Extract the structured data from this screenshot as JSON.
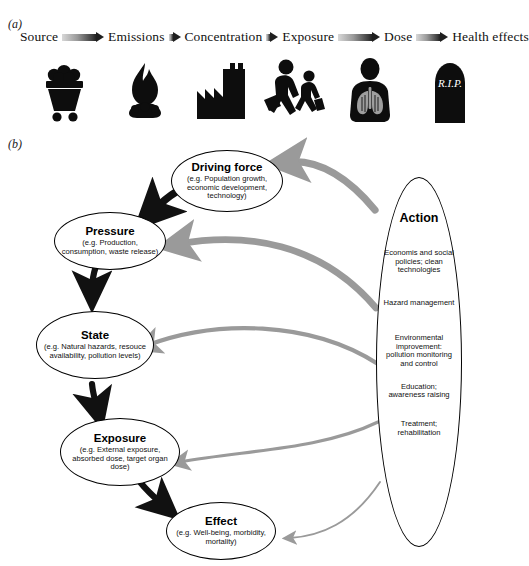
{
  "panels": {
    "a_label": "(a)",
    "b_label": "(b)"
  },
  "chain": {
    "items": [
      {
        "label": "Source",
        "icon": "coal-cart-icon"
      },
      {
        "label": "Emissions",
        "icon": "flame-icon"
      },
      {
        "label": "Concentration",
        "icon": "factory-icon"
      },
      {
        "label": "Exposure",
        "icon": "people-walking-icon"
      },
      {
        "label": "Dose",
        "icon": "torso-lungs-icon"
      },
      {
        "label": "Health effects",
        "icon": "tombstone-rip-icon"
      }
    ],
    "arrow_icon": "gradient-arrow-icon",
    "tombstone_text": "R.I.P."
  },
  "diagram": {
    "nodes": [
      {
        "id": "driving-force",
        "title": "Driving force",
        "subtitle": "(e.g. Population growth, economic development, technology)"
      },
      {
        "id": "pressure",
        "title": "Pressure",
        "subtitle": "(e.g. Production, consumption, waste release)"
      },
      {
        "id": "state",
        "title": "State",
        "subtitle": "(e.g. Natural hazards, resouce availability, pollution levels)"
      },
      {
        "id": "exposure",
        "title": "Exposure",
        "subtitle": "(e.g. External exposure, absorbed dose, target organ dose)"
      },
      {
        "id": "effect",
        "title": "Effect",
        "subtitle": "(e.g. Well-being, morbidity, mortality)"
      }
    ],
    "action": {
      "title": "Action",
      "items": [
        "Economis and social policies; clean technologies",
        "Hazard management",
        "Environmental improvement: pollution monitoring and control",
        "Education; awareness raising",
        "Treatment; rehabilitation"
      ]
    },
    "flow_edges": [
      {
        "from": "driving-force",
        "to": "pressure",
        "style": "thick-black"
      },
      {
        "from": "pressure",
        "to": "state",
        "style": "thick-black"
      },
      {
        "from": "state",
        "to": "exposure",
        "style": "thick-black"
      },
      {
        "from": "exposure",
        "to": "effect",
        "style": "thick-black"
      }
    ],
    "action_edges": [
      {
        "from": "action",
        "to": "driving-force",
        "style": "thick-gray"
      },
      {
        "from": "action",
        "to": "pressure",
        "style": "thick-gray"
      },
      {
        "from": "action",
        "to": "state",
        "style": "medium-gray"
      },
      {
        "from": "action",
        "to": "exposure",
        "style": "medium-gray"
      },
      {
        "from": "action",
        "to": "effect",
        "style": "thin-gray"
      }
    ],
    "colors": {
      "flow_arrow": "#111111",
      "action_arrow": "#9a9a9a",
      "node_stroke": "#000000",
      "background": "#ffffff"
    }
  }
}
